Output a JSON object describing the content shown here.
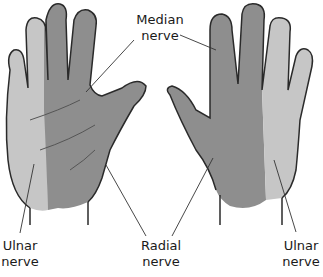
{
  "labels": {
    "median": {
      "line1": "Median",
      "line2": "nerve"
    },
    "ulnar_left": {
      "line1": "Ulnar",
      "line2": "nerve"
    },
    "radial": {
      "line1": "Radial",
      "line2": "nerve"
    },
    "ulnar_right": {
      "line1": "Ulnar",
      "line2": "nerve"
    }
  },
  "colors": {
    "median_region": "#8c8c8c",
    "ulnar_region": "#c4c4c4",
    "radial_region": "#8c8c8c",
    "outline": "#2a2a2a"
  }
}
